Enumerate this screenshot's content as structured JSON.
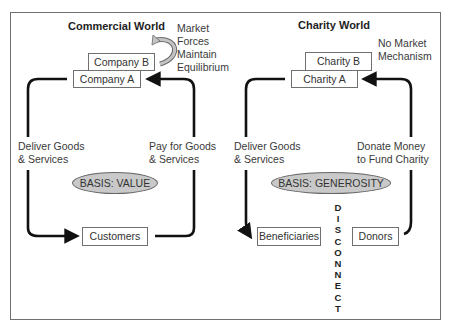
{
  "commercial": {
    "title": "Commercial World",
    "company_b": "Company B",
    "company_a": "Company A",
    "market_note": [
      "Market",
      "Forces",
      "Maintain",
      "Equilibrium"
    ],
    "left_label": [
      "Deliver Goods",
      "& Services"
    ],
    "right_label": [
      "Pay for Goods",
      "& Services"
    ],
    "basis": "BASIS: VALUE",
    "customers": "Customers"
  },
  "charity": {
    "title": "Charity World",
    "charity_b": "Charity B",
    "charity_a": "Charity A",
    "market_note": [
      "No Market",
      "Mechanism"
    ],
    "left_label": [
      "Deliver Goods",
      "& Services"
    ],
    "right_label": [
      "Donate Money",
      "to Fund Charity"
    ],
    "basis": "BASIS: GENEROSITY",
    "beneficiaries": "Beneficiaries",
    "donors": "Donors",
    "disconnect": [
      "D",
      "I",
      "S",
      "C",
      "O",
      "N",
      "N",
      "E",
      "C",
      "T"
    ]
  },
  "colors": {
    "frame": "#6f6f6f",
    "arrow": "#111111",
    "oval_fill": "#c9c9c9",
    "curved_arrow_fill": "#b9b9b9"
  }
}
